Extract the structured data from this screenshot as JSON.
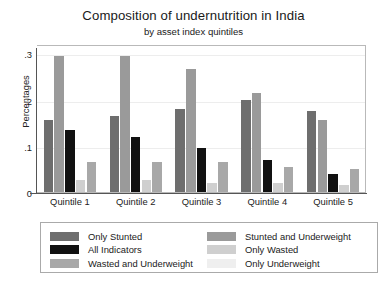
{
  "chart_data": {
    "type": "bar",
    "title": "Composition of undernutrition in India",
    "subtitle": "by asset index quintiles",
    "xlabel": "",
    "ylabel": "Percentages",
    "categories": [
      "Quintile 1",
      "Quintile 2",
      "Quintile 3",
      "Quintile 4",
      "Quintile 5"
    ],
    "ylim": [
      0,
      0.32
    ],
    "yticks": [
      0,
      0.1,
      0.2,
      0.3
    ],
    "ytick_labels": [
      "0",
      ".1",
      ".2",
      ".3"
    ],
    "grid": true,
    "legend_position": "below",
    "series": [
      {
        "name": "Only Stunted",
        "color": "#6e6e6e",
        "values": [
          0.155,
          0.165,
          0.18,
          0.2,
          0.175
        ]
      },
      {
        "name": "Stunted and Underweight",
        "color": "#9a9a9a",
        "values": [
          0.295,
          0.295,
          0.265,
          0.215,
          0.155
        ]
      },
      {
        "name": "All Indicators",
        "color": "#111111",
        "values": [
          0.135,
          0.12,
          0.095,
          0.07,
          0.04
        ]
      },
      {
        "name": "Only Wasted",
        "color": "#cfcfcf",
        "values": [
          0.025,
          0.025,
          0.02,
          0.02,
          0.015
        ]
      },
      {
        "name": "Wasted and Underweight",
        "color": "#a8a8a8",
        "values": [
          0.065,
          0.065,
          0.065,
          0.055,
          0.05
        ]
      },
      {
        "name": "Only Underweight",
        "color": "#efefef",
        "values": [
          0,
          0,
          0,
          0,
          0
        ]
      }
    ]
  },
  "legend": {
    "column_left": [
      {
        "label": "Only Stunted",
        "color": "#6e6e6e"
      },
      {
        "label": "All Indicators",
        "color": "#111111"
      },
      {
        "label": "Wasted and Underweight",
        "color": "#a8a8a8"
      }
    ],
    "column_right": [
      {
        "label": "Stunted and Underweight",
        "color": "#9a9a9a"
      },
      {
        "label": "Only Wasted",
        "color": "#cfcfcf"
      },
      {
        "label": "Only Underweight",
        "color": "#efefef"
      }
    ]
  }
}
